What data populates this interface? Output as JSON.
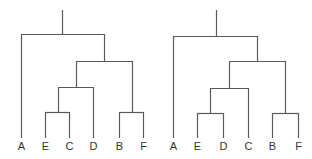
{
  "colors": {
    "background": "#ffffff",
    "line": "#5a5a5a",
    "label": "#333333"
  },
  "dendrograms": [
    {
      "id": "left-tree",
      "leaf_order": [
        "A",
        "E",
        "C",
        "D",
        "B",
        "F"
      ],
      "leaves": [
        {
          "label": "A",
          "x": 21
        },
        {
          "label": "E",
          "x": 45
        },
        {
          "label": "C",
          "x": 69
        },
        {
          "label": "D",
          "x": 93
        },
        {
          "label": "B",
          "x": 119
        },
        {
          "label": "F",
          "x": 143
        }
      ],
      "structure": "(A,(((E,C),D),(B,F)))",
      "segments": [
        [
          62,
          10,
          62,
          34
        ],
        [
          21,
          34,
          104,
          34
        ],
        [
          21,
          34,
          21,
          138
        ],
        [
          104,
          34,
          104,
          61
        ],
        [
          76,
          61,
          132,
          61
        ],
        [
          76,
          61,
          76,
          87
        ],
        [
          58,
          87,
          93,
          87
        ],
        [
          58,
          87,
          58,
          112
        ],
        [
          45,
          112,
          69,
          112
        ],
        [
          45,
          112,
          45,
          138
        ],
        [
          69,
          112,
          69,
          138
        ],
        [
          93,
          87,
          93,
          138
        ],
        [
          132,
          61,
          132,
          112
        ],
        [
          119,
          112,
          143,
          112
        ],
        [
          119,
          112,
          119,
          138
        ],
        [
          143,
          112,
          143,
          138
        ]
      ]
    },
    {
      "id": "right-tree",
      "leaf_order": [
        "A",
        "E",
        "D",
        "C",
        "B",
        "F"
      ],
      "leaves": [
        {
          "label": "A",
          "x": 173
        },
        {
          "label": "E",
          "x": 197
        },
        {
          "label": "D",
          "x": 223
        },
        {
          "label": "C",
          "x": 248
        },
        {
          "label": "B",
          "x": 272
        },
        {
          "label": "F",
          "x": 298
        }
      ],
      "structure": "(A,(((E,D),C),(B,F)))",
      "segments": [
        [
          216,
          10,
          216,
          36
        ],
        [
          173,
          36,
          257,
          36
        ],
        [
          173,
          36,
          173,
          138
        ],
        [
          257,
          36,
          257,
          61
        ],
        [
          229,
          61,
          285,
          61
        ],
        [
          229,
          61,
          229,
          88
        ],
        [
          210,
          88,
          248,
          88
        ],
        [
          210,
          88,
          210,
          113
        ],
        [
          197,
          113,
          223,
          113
        ],
        [
          197,
          113,
          197,
          138
        ],
        [
          223,
          113,
          223,
          138
        ],
        [
          248,
          88,
          248,
          138
        ],
        [
          285,
          61,
          285,
          113
        ],
        [
          272,
          113,
          298,
          113
        ],
        [
          272,
          113,
          272,
          138
        ],
        [
          298,
          113,
          298,
          138
        ]
      ]
    }
  ],
  "label_y": 150
}
